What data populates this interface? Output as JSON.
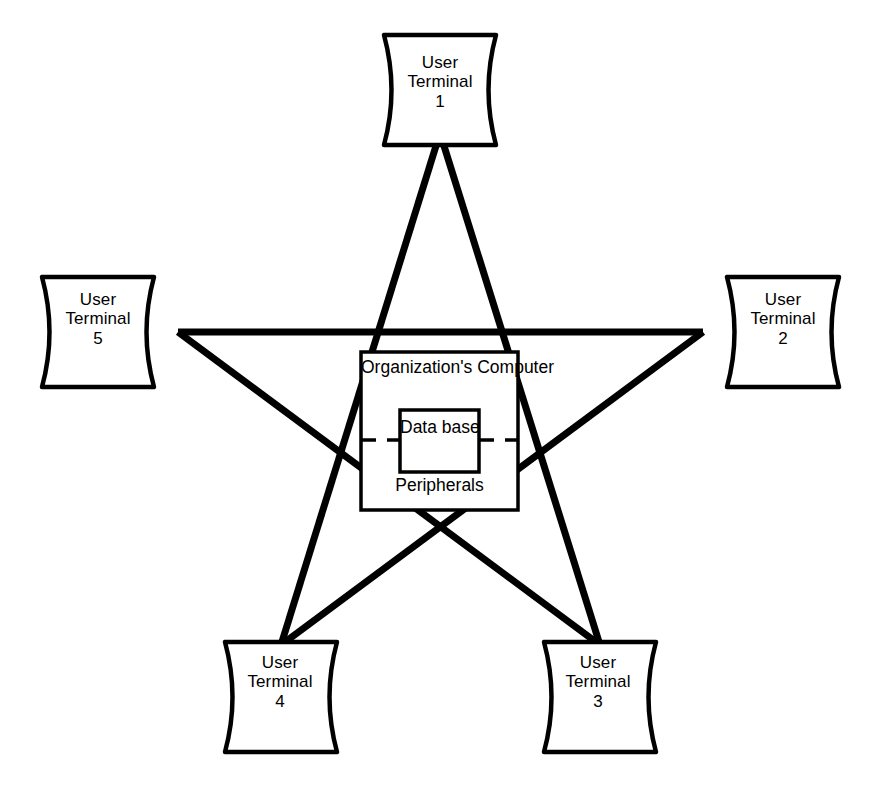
{
  "diagram": {
    "background_color": "#ffffff",
    "line_color": "#000000",
    "hub": {
      "title_line1": "Organization's",
      "title_line2": "Computer",
      "bottom_label": "Peripherals",
      "database": {
        "line1": "Data",
        "line2": "base"
      }
    },
    "terminals": [
      {
        "id": "terminal-1",
        "line1": "User",
        "line2": "Terminal",
        "line3": "1",
        "position": "top"
      },
      {
        "id": "terminal-2",
        "line1": "User",
        "line2": "Terminal",
        "line3": "2",
        "position": "right"
      },
      {
        "id": "terminal-3",
        "line1": "User",
        "line2": "Terminal",
        "line3": "3",
        "position": "bottom-right"
      },
      {
        "id": "terminal-4",
        "line1": "User",
        "line2": "Terminal",
        "line3": "4",
        "position": "bottom-left"
      },
      {
        "id": "terminal-5",
        "line1": "User",
        "line2": "Terminal",
        "line3": "5",
        "position": "left"
      }
    ],
    "connections": [
      {
        "from": "terminal-1",
        "to": "terminal-3"
      },
      {
        "from": "terminal-1",
        "to": "terminal-4"
      },
      {
        "from": "terminal-2",
        "to": "terminal-4"
      },
      {
        "from": "terminal-2",
        "to": "terminal-5"
      },
      {
        "from": "terminal-3",
        "to": "terminal-5"
      }
    ]
  }
}
